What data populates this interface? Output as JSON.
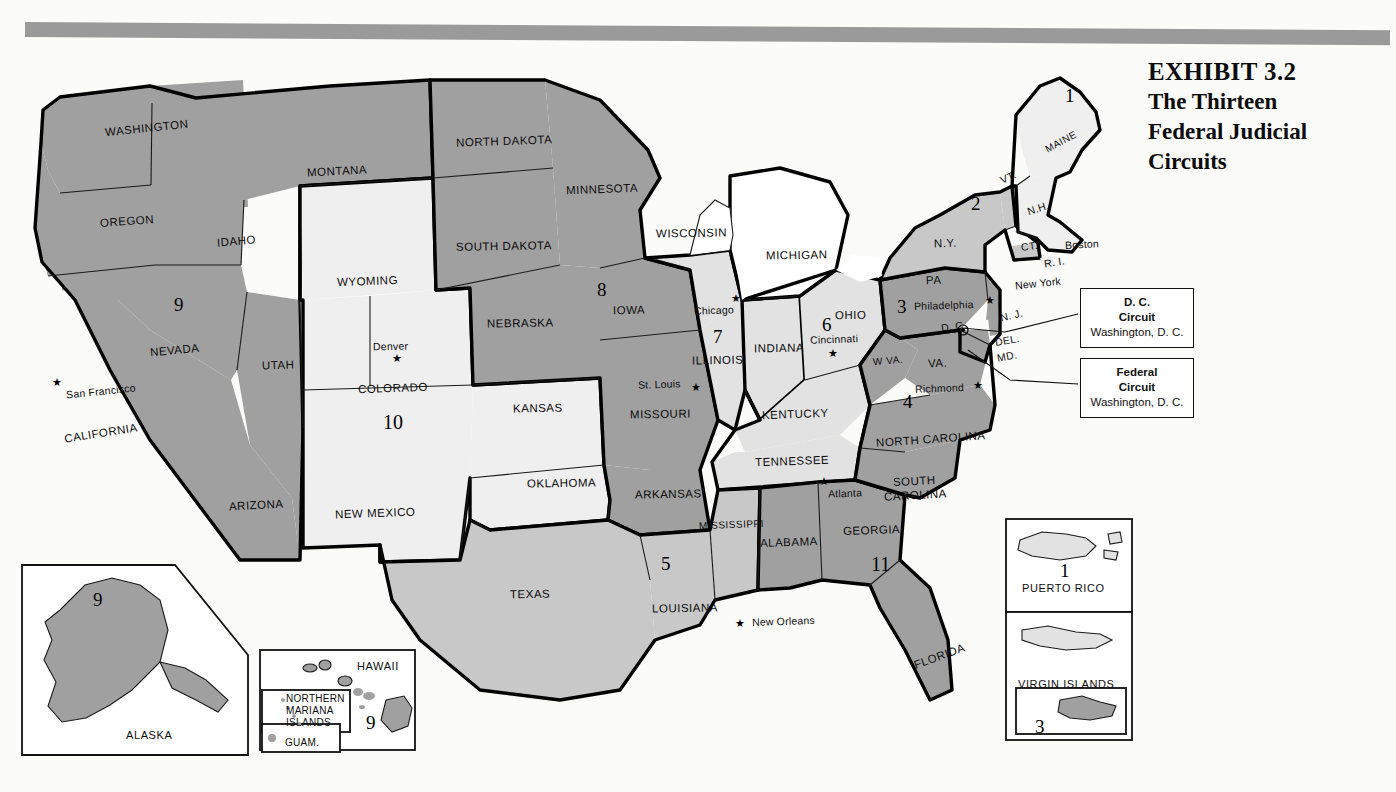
{
  "exhibit": {
    "number_line": "EXHIBIT 3.2",
    "title_line_1": "The Thirteen",
    "title_line_2": "Federal Judicial",
    "title_line_3": "Circuits"
  },
  "colors": {
    "rule_gray": "#9a9a9a",
    "shade_dark": "#a0a0a0",
    "shade_mid": "#c8c8c8",
    "shade_light": "#e0e0e0",
    "shade_pale": "#efefef",
    "white": "#ffffff",
    "outline": "#111111"
  },
  "callouts": [
    {
      "id": "dc-circuit",
      "line1": "D. C.",
      "line2": "Circuit",
      "line3": "Washington, D. C."
    },
    {
      "id": "federal-circuit",
      "line1": "Federal",
      "line2": "Circuit",
      "line3": "Washington, D. C."
    }
  ],
  "circuit_numbers": [
    {
      "id": "c1-maine",
      "label": "1",
      "x": 1065,
      "y": 86
    },
    {
      "id": "c2-ny",
      "label": "2",
      "x": 971,
      "y": 194
    },
    {
      "id": "c3-pa",
      "label": "3",
      "x": 897,
      "y": 297
    },
    {
      "id": "c4-va",
      "label": "4",
      "x": 903,
      "y": 392
    },
    {
      "id": "c5-la",
      "label": "5",
      "x": 661,
      "y": 554
    },
    {
      "id": "c6-oh",
      "label": "6",
      "x": 822,
      "y": 315
    },
    {
      "id": "c7-il",
      "label": "7",
      "x": 713,
      "y": 327
    },
    {
      "id": "c8-ia",
      "label": "8",
      "x": 597,
      "y": 280
    },
    {
      "id": "c9-nv",
      "label": "9",
      "x": 174,
      "y": 295
    },
    {
      "id": "c10-co",
      "label": "10",
      "x": 383,
      "y": 412
    },
    {
      "id": "c11-ga",
      "label": "11",
      "x": 871,
      "y": 554
    },
    {
      "id": "c9-alaska",
      "label": "9",
      "x": 93,
      "y": 590
    },
    {
      "id": "c9-hawaii",
      "label": "9",
      "x": 366,
      "y": 713
    },
    {
      "id": "c1-pr",
      "label": "1",
      "x": 1060,
      "y": 561
    },
    {
      "id": "c3-vi",
      "label": "3",
      "x": 1035,
      "y": 717
    }
  ],
  "states": [
    {
      "name": "WASHINGTON",
      "x": 105,
      "y": 123,
      "rot": -6,
      "cls": "state"
    },
    {
      "name": "OREGON",
      "x": 100,
      "y": 216,
      "rot": -4,
      "cls": "state"
    },
    {
      "name": "IDAHO",
      "x": 217,
      "y": 236,
      "rot": -5,
      "cls": "state"
    },
    {
      "name": "MONTANA",
      "x": 307,
      "y": 166,
      "rot": -3,
      "cls": "state"
    },
    {
      "name": "NORTH DAKOTA",
      "x": 456,
      "y": 136,
      "rot": -2,
      "cls": "state"
    },
    {
      "name": "SOUTH DAKOTA",
      "x": 456,
      "y": 241,
      "rot": -1,
      "cls": "state"
    },
    {
      "name": "MINNESOTA",
      "x": 566,
      "y": 184,
      "rot": -2,
      "cls": "state"
    },
    {
      "name": "WISCONSIN",
      "x": 656,
      "y": 228,
      "rot": -1,
      "cls": "state"
    },
    {
      "name": "MICHIGAN",
      "x": 766,
      "y": 250,
      "rot": -1,
      "cls": "state"
    },
    {
      "name": "NEVADA",
      "x": 150,
      "y": 345,
      "rot": -5,
      "cls": "state"
    },
    {
      "name": "CALIFORNIA",
      "x": 64,
      "y": 428,
      "rot": -9,
      "cls": "state"
    },
    {
      "name": "UTAH",
      "x": 262,
      "y": 360,
      "rot": -2,
      "cls": "state"
    },
    {
      "name": "WYOMING",
      "x": 337,
      "y": 276,
      "rot": -2,
      "cls": "state"
    },
    {
      "name": "COLORADO",
      "x": 358,
      "y": 383,
      "rot": -2,
      "cls": "state"
    },
    {
      "name": "NEBRASKA",
      "x": 487,
      "y": 318,
      "rot": -1,
      "cls": "state"
    },
    {
      "name": "KANSAS",
      "x": 513,
      "y": 403,
      "rot": -1,
      "cls": "state"
    },
    {
      "name": "IOWA",
      "x": 613,
      "y": 305,
      "rot": -1,
      "cls": "state"
    },
    {
      "name": "MISSOURI",
      "x": 630,
      "y": 409,
      "rot": -1,
      "cls": "state"
    },
    {
      "name": "ILLINOIS",
      "x": 692,
      "y": 355,
      "rot": -1,
      "cls": "state"
    },
    {
      "name": "INDIANA",
      "x": 754,
      "y": 343,
      "rot": -1,
      "cls": "state"
    },
    {
      "name": "OHIO",
      "x": 835,
      "y": 310,
      "rot": -1,
      "cls": "state"
    },
    {
      "name": "KENTUCKY",
      "x": 762,
      "y": 409,
      "rot": -2,
      "cls": "state"
    },
    {
      "name": "TENNESSEE",
      "x": 755,
      "y": 456,
      "rot": -2,
      "cls": "state"
    },
    {
      "name": "ARIZONA",
      "x": 229,
      "y": 500,
      "rot": -3,
      "cls": "state"
    },
    {
      "name": "NEW MEXICO",
      "x": 335,
      "y": 508,
      "rot": -2,
      "cls": "state"
    },
    {
      "name": "OKLAHOMA",
      "x": 527,
      "y": 478,
      "rot": -1,
      "cls": "state"
    },
    {
      "name": "TEXAS",
      "x": 510,
      "y": 589,
      "rot": -1,
      "cls": "state"
    },
    {
      "name": "ARKANSAS",
      "x": 635,
      "y": 489,
      "rot": -1,
      "cls": "state"
    },
    {
      "name": "LOUISIANA",
      "x": 652,
      "y": 603,
      "rot": -1,
      "cls": "state"
    },
    {
      "name": "MISSISSIPPI",
      "x": 699,
      "y": 520,
      "rot": -2,
      "cls": "state sm"
    },
    {
      "name": "ALABAMA",
      "x": 760,
      "y": 537,
      "rot": -2,
      "cls": "state"
    },
    {
      "name": "GEORGIA",
      "x": 843,
      "y": 525,
      "rot": -2,
      "cls": "state"
    },
    {
      "name": "FLORIDA",
      "x": 913,
      "y": 651,
      "rot": -20,
      "cls": "state"
    },
    {
      "name": "SOUTH",
      "x": 893,
      "y": 476,
      "rot": -3,
      "cls": "state"
    },
    {
      "name": "CAROLINA",
      "x": 884,
      "y": 490,
      "rot": -3,
      "cls": "state"
    },
    {
      "name": "NORTH CAROLINA",
      "x": 876,
      "y": 434,
      "rot": -4,
      "cls": "state"
    },
    {
      "name": "VA.",
      "x": 928,
      "y": 358,
      "rot": -3,
      "cls": "state"
    },
    {
      "name": "W VA.",
      "x": 873,
      "y": 356,
      "rot": -5,
      "cls": "state sm"
    },
    {
      "name": "PA",
      "x": 926,
      "y": 275,
      "rot": -2,
      "cls": "state"
    },
    {
      "name": "N.Y.",
      "x": 934,
      "y": 238,
      "rot": -2,
      "cls": "state"
    },
    {
      "name": "MAINE",
      "x": 1044,
      "y": 137,
      "rot": -28,
      "cls": "state sm"
    },
    {
      "name": "VT.",
      "x": 1000,
      "y": 172,
      "rot": -24,
      "cls": "abbr"
    },
    {
      "name": "N.H.",
      "x": 1027,
      "y": 203,
      "rot": -18,
      "cls": "abbr"
    },
    {
      "name": "CT.",
      "x": 1021,
      "y": 241,
      "rot": -8,
      "cls": "abbr"
    },
    {
      "name": "R. I.",
      "x": 1044,
      "y": 257,
      "rot": -9,
      "cls": "abbr"
    },
    {
      "name": "N. J.",
      "x": 1000,
      "y": 310,
      "rot": -13,
      "cls": "abbr"
    },
    {
      "name": "DEL.",
      "x": 995,
      "y": 335,
      "rot": -10,
      "cls": "abbr"
    },
    {
      "name": "MD.",
      "x": 997,
      "y": 351,
      "rot": -10,
      "cls": "abbr"
    },
    {
      "name": "D. C.",
      "x": 941,
      "y": 321,
      "rot": -8,
      "cls": "abbr"
    }
  ],
  "cities": [
    {
      "name": "Chicago",
      "x": 694,
      "y": 305,
      "rot": -2,
      "star_x": 731,
      "star_y": 293
    },
    {
      "name": "Cincinnati",
      "x": 810,
      "y": 334,
      "rot": -2,
      "star_x": 828,
      "star_y": 348
    },
    {
      "name": "St. Louis",
      "x": 638,
      "y": 379,
      "rot": -2,
      "star_x": 691,
      "star_y": 382
    },
    {
      "name": "Denver",
      "x": 373,
      "y": 341,
      "rot": -1,
      "star_x": 392,
      "star_y": 353
    },
    {
      "name": "San Francisco",
      "x": 66,
      "y": 386,
      "rot": -6,
      "star_x": 52,
      "star_y": 377
    },
    {
      "name": "New Orleans",
      "x": 752,
      "y": 616,
      "rot": -2,
      "star_x": 735,
      "star_y": 618
    },
    {
      "name": "Atlanta",
      "x": 828,
      "y": 488,
      "rot": -2,
      "star_x": 819,
      "star_y": 476
    },
    {
      "name": "Philadelphia",
      "x": 914,
      "y": 300,
      "rot": -2,
      "star_x": 985,
      "star_y": 295
    },
    {
      "name": "Richmond",
      "x": 915,
      "y": 383,
      "rot": -2,
      "star_x": 973,
      "star_y": 380
    },
    {
      "name": "Boston",
      "x": 1065,
      "y": 239,
      "rot": -3,
      "star_x": null,
      "star_y": null
    },
    {
      "name": "New York",
      "x": 1015,
      "y": 278,
      "rot": -6,
      "star_x": null,
      "star_y": null
    }
  ],
  "insets": [
    {
      "id": "alaska",
      "title": "ALASKA"
    },
    {
      "id": "hawaii",
      "title": "HAWAII"
    },
    {
      "id": "nmi",
      "title_1": "NORTHERN",
      "title_2": "MARIANA",
      "title_3": "ISLANDS"
    },
    {
      "id": "guam",
      "title": "GUAM."
    },
    {
      "id": "pr",
      "title": "PUERTO RICO"
    },
    {
      "id": "vi",
      "title": "VIRGIN ISLANDS"
    }
  ]
}
